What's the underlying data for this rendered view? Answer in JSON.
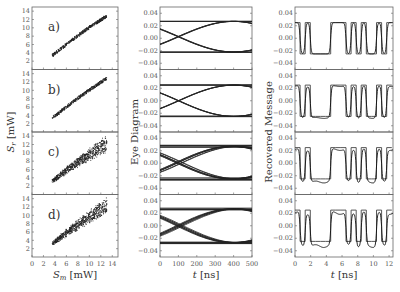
{
  "chart_data": [
    {
      "type": "scatter",
      "title": "",
      "xlabel": "S_m [mW]",
      "ylabel": "S_r [mW]",
      "xlim": [
        0,
        15
      ],
      "ylim": [
        0,
        15
      ],
      "xticks": [
        0,
        2,
        4,
        6,
        8,
        10,
        12,
        14
      ],
      "yticks": [
        2,
        4,
        6,
        8,
        10,
        12,
        14
      ],
      "panels": [
        {
          "label": "a)",
          "x_range": [
            3.5,
            13
          ],
          "y_range": [
            3.5,
            13.5
          ],
          "spread": "narrow"
        },
        {
          "label": "b)",
          "x_range": [
            3.5,
            13
          ],
          "y_range": [
            3.5,
            13.5
          ],
          "spread": "narrow"
        },
        {
          "label": "c)",
          "x_range": [
            3.5,
            13
          ],
          "y_range": [
            3.5,
            14
          ],
          "spread": "wide"
        },
        {
          "label": "d)",
          "x_range": [
            3.5,
            13
          ],
          "y_range": [
            3.5,
            14
          ],
          "spread": "wide"
        }
      ]
    },
    {
      "type": "line",
      "title": "",
      "xlabel": "t [ns]",
      "ylabel": "Eye Diagram",
      "xlim": [
        0,
        500
      ],
      "ylim": [
        -0.05,
        0.05
      ],
      "xticks": [
        0,
        100,
        200,
        300,
        400,
        500
      ],
      "yticks": [
        -0.04,
        -0.02,
        0.0,
        0.02,
        0.04
      ],
      "panels": [
        {
          "label": "a",
          "levels": [
            0.027,
            -0.022
          ],
          "eye_open": true
        },
        {
          "label": "b",
          "levels": [
            0.025,
            -0.025
          ],
          "eye_open": true
        },
        {
          "label": "c",
          "levels": [
            0.027,
            -0.025
          ],
          "eye_open": true,
          "noisy": true
        },
        {
          "label": "d",
          "levels": [
            0.027,
            -0.027
          ],
          "eye_open": true,
          "noisy": true
        }
      ]
    },
    {
      "type": "line",
      "title": "",
      "xlabel": "t [ns]",
      "ylabel": "Recovered Message",
      "xlim": [
        0,
        12.5
      ],
      "ylim": [
        -0.05,
        0.05
      ],
      "xticks": [
        0,
        2,
        4,
        6,
        8,
        10,
        12
      ],
      "yticks": [
        -0.04,
        -0.02,
        0.0,
        0.02,
        0.04
      ],
      "bits": [
        1,
        0,
        1,
        0,
        0,
        0,
        0,
        1,
        1,
        1,
        0,
        1,
        0,
        1,
        0,
        0,
        1,
        0,
        1
      ],
      "bit_period_ns": 0.65,
      "high": 0.025,
      "low": -0.025
    }
  ],
  "labels": {
    "left_xlabel_main": "S",
    "left_xlabel_sub": "m",
    "left_xlabel_unit": " [mW]",
    "left_ylabel_main": "S",
    "left_ylabel_sub": "r",
    "left_ylabel_unit": " [mW]",
    "mid_xlabel_t": "t",
    "mid_xlabel_unit": " [ns]",
    "mid_ylabel": "Eye Diagram",
    "right_xlabel_t": "t",
    "right_xlabel_unit": " [ns]",
    "right_ylabel": "Recovered Message",
    "panel_a": "a)",
    "panel_b": "b)",
    "panel_c": "c)",
    "panel_d": "d)"
  }
}
